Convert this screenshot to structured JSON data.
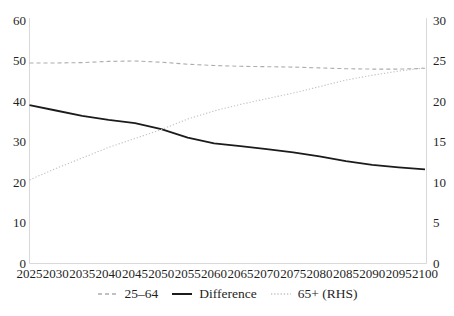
{
  "chart_data": {
    "type": "line",
    "title": "",
    "xlabel": "",
    "ylabel_left": "",
    "ylabel_right": "",
    "grid": false,
    "background": "#ffffff",
    "spine_color": "#d9d9d9",
    "x": {
      "years": [
        2025,
        2030,
        2035,
        2040,
        2045,
        2050,
        2055,
        2060,
        2065,
        2070,
        2075,
        2080,
        2085,
        2090,
        2095,
        2100
      ]
    },
    "left_axis": {
      "range": [
        0,
        60
      ],
      "ticks": [
        0,
        10,
        20,
        30,
        40,
        50,
        60
      ]
    },
    "right_axis": {
      "range": [
        0,
        30
      ],
      "ticks": [
        0,
        5,
        10,
        15,
        20,
        25,
        30
      ]
    },
    "series": [
      {
        "name": "25–64",
        "axis": "left",
        "style": "dashed",
        "color": "#adadad",
        "values": [
          49.4,
          49.4,
          49.5,
          49.8,
          49.9,
          49.6,
          49.1,
          48.8,
          48.6,
          48.5,
          48.4,
          48.2,
          48.0,
          47.9,
          47.9,
          48.1
        ]
      },
      {
        "name": "Difference",
        "axis": "left",
        "style": "solid",
        "color": "#1b1b1b",
        "values": [
          39.0,
          37.7,
          36.4,
          35.4,
          34.6,
          33.1,
          31.0,
          29.6,
          28.9,
          28.2,
          27.4,
          26.4,
          25.2,
          24.3,
          23.7,
          23.2
        ]
      },
      {
        "name": "65+ (RHS)",
        "axis": "right",
        "style": "dotted",
        "color": "#c3c3c3",
        "values": [
          10.3,
          11.7,
          13.0,
          14.3,
          15.4,
          16.5,
          17.8,
          18.8,
          19.6,
          20.3,
          21.0,
          21.8,
          22.6,
          23.2,
          23.7,
          24.1
        ]
      }
    ],
    "legend": {
      "position": "bottom",
      "items": [
        "25–64",
        "Difference",
        "65+ (RHS)"
      ]
    }
  }
}
